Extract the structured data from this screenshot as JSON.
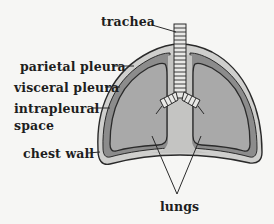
{
  "diagram": {
    "labels": {
      "trachea": "trachea",
      "parietal_pleura": "parietal pleura",
      "visceral_pleura": "visceral pleura",
      "intrapleural_line1": "intrapleural",
      "intrapleural_line2": "space",
      "chest_wall": "chest wall",
      "lungs": "lungs"
    },
    "colors": {
      "background": "#f6f6f4",
      "chest_wall": "#cfcfcd",
      "parietal_pleura": "#8c8c8c",
      "intrapleural_space": "#8c8c8c",
      "lung": "#a9a9a9",
      "mediastinum": "#c4c4c2",
      "outline": "#2a2a2a",
      "trachea_ring": "#e8e8e6"
    }
  }
}
